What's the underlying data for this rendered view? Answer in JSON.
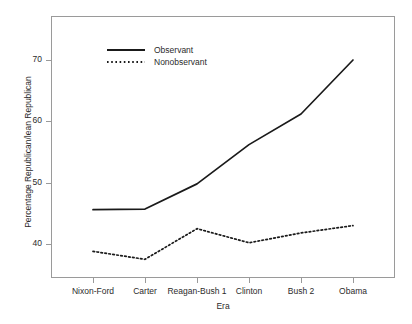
{
  "chart_data": {
    "type": "line",
    "title": "",
    "subtitle": "",
    "xlabel": "Era",
    "ylabel": "Percentage Republican/lean Republican",
    "categories": [
      "Nixon-Ford",
      "Carter",
      "Reagan-Bush 1",
      "Clinton",
      "Bush 2",
      "Obama"
    ],
    "series": [
      {
        "name": "Observant",
        "style": "solid",
        "color": "#1a1a1a",
        "values": [
          45.6,
          45.7,
          49.8,
          56.2,
          61.2,
          70.0
        ]
      },
      {
        "name": "Nonobservant",
        "style": "dotted",
        "color": "#1a1a1a",
        "values": [
          38.8,
          37.5,
          42.5,
          40.2,
          41.8,
          43.0
        ]
      }
    ],
    "ylim": [
      35.0,
      72.8
    ],
    "yticks": [
      40,
      50,
      60,
      70
    ],
    "ytick_labels": [
      "40",
      "50",
      "60",
      "70"
    ],
    "grid": false,
    "legend_position": "top-left",
    "frame": true
  },
  "axes": {
    "y_tick_labels": [
      "70",
      "60",
      "50",
      "40"
    ],
    "x_tick_labels": [
      "Nixon-Ford",
      "Carter",
      "Reagan-Bush 1",
      "Clinton",
      "Bush 2",
      "Obama"
    ],
    "x_title": "Era",
    "y_title": "Percentage Republican/lean Republican"
  },
  "legend": {
    "entries": [
      {
        "label": "Observant",
        "style": "solid"
      },
      {
        "label": "Nonobservant",
        "style": "dotted"
      }
    ]
  },
  "colors": {
    "line": "#1a1a1a",
    "frame": "#9a9a9a",
    "text": "#2b2b2b",
    "background": "#ffffff"
  }
}
